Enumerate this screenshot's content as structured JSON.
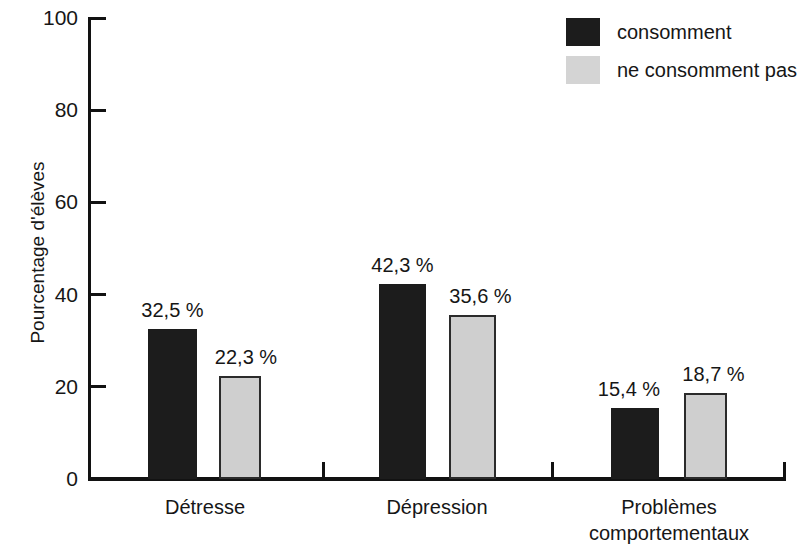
{
  "chart_data": {
    "type": "bar",
    "title": "",
    "subtitle": "",
    "xlabel": "",
    "ylabel": "Pourcentage d'élèves",
    "ylim": [
      0,
      100
    ],
    "yticks": [
      0,
      20,
      40,
      60,
      80,
      100
    ],
    "ytick_labels": [
      "0",
      "20",
      "40",
      "60",
      "80",
      "100"
    ],
    "grid": false,
    "legend_position": "top-right",
    "categories": [
      "Détresse",
      "Dépression",
      "Problèmes comportementaux"
    ],
    "category_label_lines": [
      [
        "Détresse"
      ],
      [
        "Dépression"
      ],
      [
        "Problèmes",
        "comportementaux"
      ]
    ],
    "series": [
      {
        "name": "consomment",
        "color": "#1c1c1c",
        "values": [
          32.5,
          42.3,
          15.4
        ],
        "value_labels": [
          "32,5 %",
          "42,3 %",
          "15,4 %"
        ]
      },
      {
        "name": "ne consomment pas",
        "color": "#cfcfcf",
        "values": [
          22.3,
          35.6,
          18.7
        ],
        "value_labels": [
          "22,3 %",
          "35,6 %",
          "18,7 %"
        ]
      }
    ]
  },
  "legend": {
    "items": [
      {
        "label": "consomment",
        "swatch": "black-square-swatch"
      },
      {
        "label": "ne consomment pas",
        "swatch": "gray-square-swatch"
      }
    ]
  },
  "axes": {
    "y_title": "Pourcentage d'élèves",
    "y_tick_labels": [
      "100",
      "80",
      "60",
      "40",
      "20",
      "0"
    ]
  }
}
